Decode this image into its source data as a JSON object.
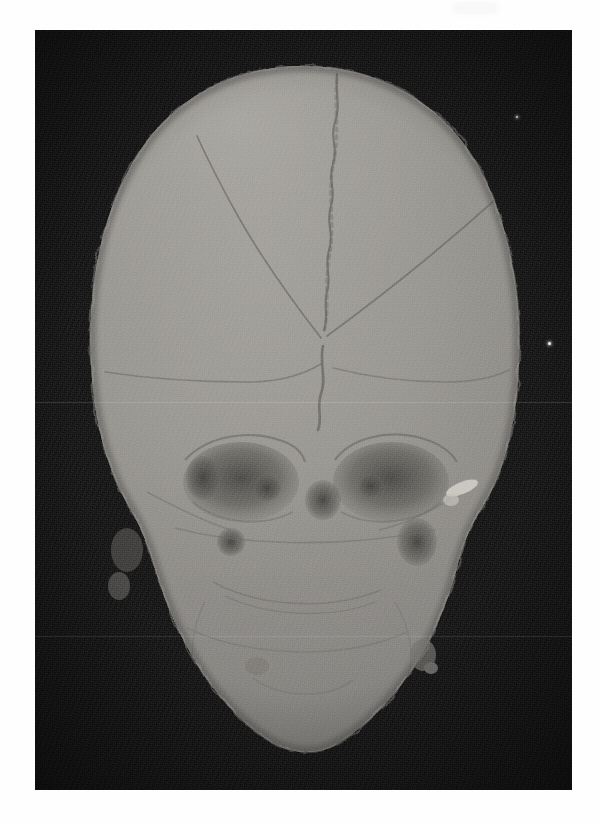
{
  "document": {
    "kind": "medical-image-figure",
    "modality_label": "CT",
    "view_label": "Anterior (frontal) view",
    "render_label": "3D volume rendering",
    "subject_label": "Human skull",
    "background_color": "#0b0b0b",
    "bone_color": "#8a8a8a",
    "bone_highlight_color": "#b9b7b1",
    "bone_shadow_color": "#5d5d5d",
    "suture_color": "#4a4a4a",
    "paper_color": "#fefefe"
  },
  "plate": {
    "left": 35,
    "top": 30,
    "width": 537,
    "height": 760,
    "has_grain": true,
    "has_vignette": true
  },
  "artifacts": {
    "scanlines": [
      {
        "name": "upper-scanline",
        "y": 372,
        "opacity": 0.13
      },
      {
        "name": "lower-scanline",
        "y": 606,
        "opacity": 0.1
      }
    ],
    "specks": [
      {
        "name": "right-field-speck",
        "x": 513,
        "y": 312,
        "size": 3
      },
      {
        "name": "upper-right-speck",
        "x": 481,
        "y": 86,
        "size": 2
      }
    ],
    "paper_mark": {
      "x": 452,
      "y": 2,
      "width": 46,
      "height": 12
    }
  },
  "anatomy": {
    "regions": [
      {
        "name": "cranial-vault",
        "label": "Cranial vault (calvaria)"
      },
      {
        "name": "frontal-bone",
        "label": "Frontal bone"
      },
      {
        "name": "parietal-bone-left",
        "label": "Left parietal bone"
      },
      {
        "name": "parietal-bone-right",
        "label": "Right parietal bone"
      },
      {
        "name": "orbit-left",
        "label": "Left orbit"
      },
      {
        "name": "orbit-right",
        "label": "Right orbit"
      },
      {
        "name": "midface",
        "label": "Midface / maxilla"
      },
      {
        "name": "mandible",
        "label": "Mandible"
      },
      {
        "name": "zygomatic-arch-right",
        "label": "Right zygomatic fragment"
      },
      {
        "name": "temporal-region-left",
        "label": "Left temporal region"
      }
    ],
    "sutures": [
      {
        "name": "sagittal-suture",
        "label": "Sagittal suture"
      },
      {
        "name": "coronal-suture-left",
        "label": "Left coronal suture"
      },
      {
        "name": "coronal-suture-right",
        "label": "Right coronal suture"
      },
      {
        "name": "metopic-remnant",
        "label": "Metopic suture remnant"
      },
      {
        "name": "lambdoid-branch",
        "label": "Lambdoid branch"
      }
    ]
  },
  "chart_data": {
    "type": "heatmap",
    "xlabel": "",
    "ylabel": ""
  }
}
